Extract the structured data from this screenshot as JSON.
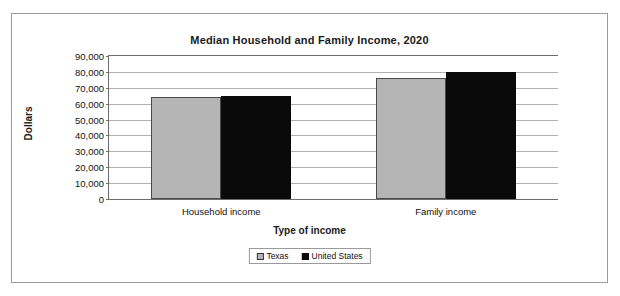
{
  "chart_data": {
    "type": "bar",
    "title": "Median Household and Family Income, 2020",
    "xlabel": "Type of income",
    "ylabel": "Dollars",
    "categories": [
      "Household income",
      "Family income"
    ],
    "series": [
      {
        "name": "Texas",
        "color": "#b5b5b5",
        "values": [
          64000,
          76000
        ]
      },
      {
        "name": "United States",
        "color": "#000000",
        "values": [
          65000,
          80000
        ]
      }
    ],
    "ylim": [
      0,
      90000
    ],
    "ytick_step": 10000,
    "ytick_labels": [
      "90,000",
      "80,000",
      "70,000",
      "60,000",
      "50,000",
      "40,000",
      "30,000",
      "20,000",
      "10,000",
      "0"
    ],
    "ytick_values": [
      90000,
      80000,
      70000,
      60000,
      50000,
      40000,
      30000,
      20000,
      10000,
      0
    ],
    "grid": true,
    "legend_position": "bottom"
  },
  "legend": {
    "items": [
      {
        "label": "Texas",
        "swatch": "texas"
      },
      {
        "label": "United States",
        "swatch": "us"
      }
    ]
  }
}
